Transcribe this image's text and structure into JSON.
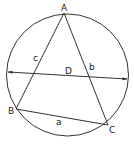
{
  "diagram": {
    "circle": {
      "cx": 67.5,
      "cy": 75,
      "r": 61
    },
    "stroke_color": "#333333",
    "vertices": {
      "A": {
        "label": "A",
        "x": 64,
        "y": 13
      },
      "B": {
        "label": "B",
        "x": 16,
        "y": 109
      },
      "C": {
        "label": "C",
        "x": 108,
        "y": 125
      }
    },
    "sides": {
      "a": {
        "label": "a"
      },
      "b": {
        "label": "b"
      },
      "c": {
        "label": "c"
      }
    },
    "diameter": {
      "label": "D",
      "x1": 7,
      "y1": 72,
      "x2": 128,
      "y2": 79
    }
  }
}
